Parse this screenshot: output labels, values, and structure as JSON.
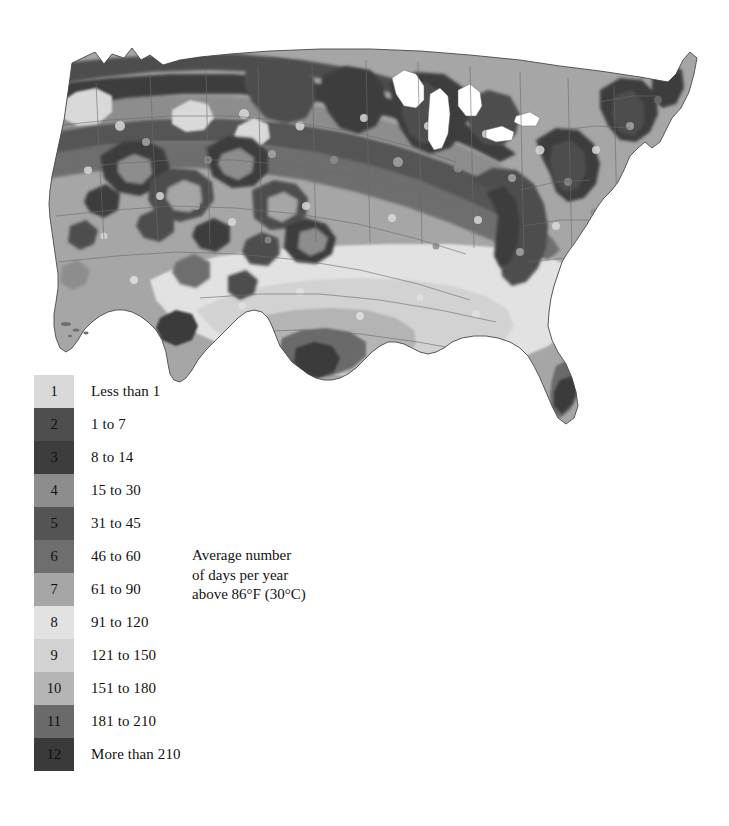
{
  "map": {
    "title": "Average number of days per year above 86°F (30°C)",
    "region": "Contiguous United States",
    "background_color": "#ffffff",
    "state_border_color": "#6b6b6b",
    "coastline_color": "#4a4a4a"
  },
  "legend": {
    "name": "climate-class-legend",
    "classes": [
      {
        "index": "1",
        "label": "Less than 1",
        "color": "#d9d9d9",
        "min": 0,
        "max": 1
      },
      {
        "index": "2",
        "label": "1 to 7",
        "color": "#4e4e4e",
        "min": 1,
        "max": 7
      },
      {
        "index": "3",
        "label": "8 to 14",
        "color": "#3d3d3d",
        "min": 8,
        "max": 14
      },
      {
        "index": "4",
        "label": "15 to 30",
        "color": "#8d8d8d",
        "min": 15,
        "max": 30
      },
      {
        "index": "5",
        "label": "31 to 45",
        "color": "#545454",
        "min": 31,
        "max": 45
      },
      {
        "index": "6",
        "label": "46 to 60",
        "color": "#6e6e6e",
        "min": 46,
        "max": 60
      },
      {
        "index": "7",
        "label": "61 to 90",
        "color": "#a6a6a6",
        "min": 61,
        "max": 90
      },
      {
        "index": "8",
        "label": "91 to 120",
        "color": "#e2e2e2",
        "min": 91,
        "max": 120
      },
      {
        "index": "9",
        "label": "121 to 150",
        "color": "#d2d2d2",
        "min": 121,
        "max": 150
      },
      {
        "index": "10",
        "label": "151 to 180",
        "color": "#b4b4b4",
        "min": 151,
        "max": 180
      },
      {
        "index": "11",
        "label": "181 to 210",
        "color": "#6a6a6a",
        "min": 181,
        "max": 210
      },
      {
        "index": "12",
        "label": "More than 210",
        "color": "#3a3a3a",
        "min": 211,
        "max": 365
      }
    ]
  },
  "caption": {
    "line1": "Average number",
    "line2": "of days per year",
    "line3": "above 86°F (30°C)"
  }
}
